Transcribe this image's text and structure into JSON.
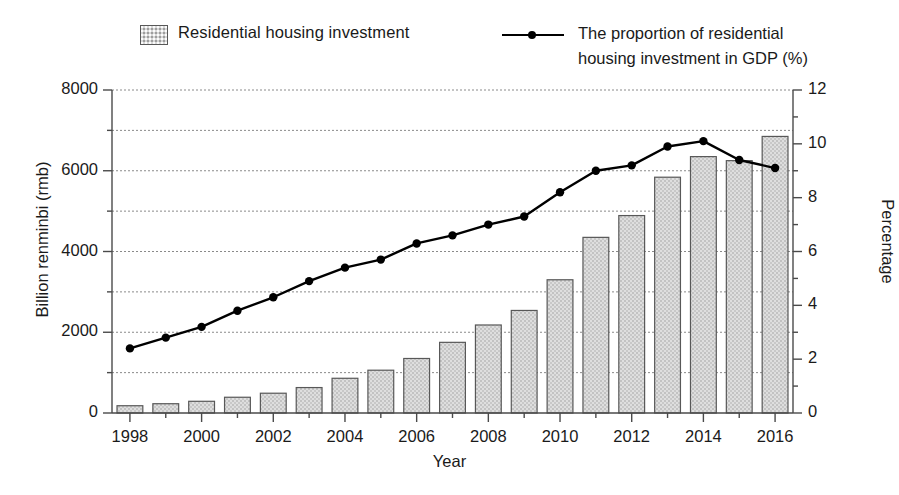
{
  "legend": {
    "bar_label": "Residential housing investment",
    "line_label": "The proportion of residential\nhousing investment in GDP (%)",
    "bar_swatch": "bar-pattern-swatch",
    "line_marker": "line-dot-marker"
  },
  "axes": {
    "y_left_title": "Billion renminbi (rmb)",
    "y_right_title": "Percentage",
    "x_title": "Year",
    "y_left_ticks": [
      "0",
      "2000",
      "4000",
      "6000",
      "8000"
    ],
    "y_right_ticks": [
      "0",
      "2",
      "4",
      "6",
      "8",
      "10",
      "12"
    ],
    "x_ticks": [
      "1998",
      "2000",
      "2002",
      "2004",
      "2006",
      "2008",
      "2010",
      "2012",
      "2014",
      "2016"
    ]
  },
  "colors": {
    "bar_fill": "#d8d8d8",
    "bar_border": "#585858",
    "line": "#000000",
    "grid": "#8a8a8a",
    "axis": "#4a4a4a",
    "background": "#ffffff"
  },
  "chart_data": {
    "type": "bar",
    "title": "",
    "xlabel": "Year",
    "ylabel": "Billion renminbi (rmb)",
    "y2label": "Percentage",
    "categories": [
      1998,
      1999,
      2000,
      2001,
      2002,
      2003,
      2004,
      2005,
      2006,
      2007,
      2008,
      2009,
      2010,
      2011,
      2012,
      2013,
      2014,
      2015,
      2016
    ],
    "ylim": [
      0,
      8000
    ],
    "y2lim": [
      0,
      12
    ],
    "grid": true,
    "legend_position": "top",
    "series": [
      {
        "name": "Residential housing investment",
        "type": "bar",
        "axis": "left",
        "unit": "Billion renminbi (rmb)",
        "values": [
          180,
          230,
          290,
          390,
          490,
          630,
          860,
          1060,
          1350,
          1750,
          2180,
          2540,
          3300,
          4350,
          4890,
          5840,
          6350,
          6250,
          6850
        ]
      },
      {
        "name": "The proportion of residential housing investment in GDP (%)",
        "type": "line",
        "axis": "right",
        "unit": "%",
        "values": [
          2.4,
          2.8,
          3.2,
          3.8,
          4.3,
          4.9,
          5.4,
          5.7,
          6.3,
          6.6,
          7.0,
          7.3,
          8.2,
          9.0,
          9.2,
          9.9,
          10.1,
          9.4,
          9.1
        ]
      }
    ]
  }
}
